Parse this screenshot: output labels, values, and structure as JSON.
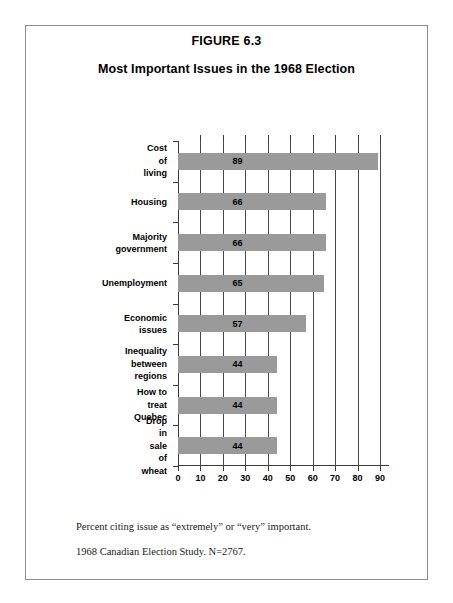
{
  "figure": {
    "number": "FIGURE 6.3",
    "title": "Most Important Issues in the 1968 Election"
  },
  "footnotes": [
    "Percent citing issue as “extremely” or “very” important.",
    "1968 Canadian Election Study.  N=2767."
  ],
  "colors": {
    "bar_fill": "#9a9a9a",
    "gridline": "#4a4a4a",
    "axis": "#3a3a3a",
    "border": "#8d8d8d",
    "text": "#000000"
  },
  "chart_data": {
    "type": "bar",
    "orientation": "horizontal",
    "title": "Most Important Issues in the 1968 Election",
    "subtitle": "FIGURE 6.3",
    "xlabel": "",
    "ylabel": "",
    "categories": [
      "Cost of living",
      "Housing",
      "Majority\ngovernment",
      "Unemployment",
      "Economic\nissues",
      "Inequality\nbetween\nregions",
      "How to treat\nQuebec",
      "Drop in sale of\nwheat"
    ],
    "values": [
      89,
      66,
      66,
      65,
      57,
      44,
      44,
      44
    ],
    "value_labels": [
      "89",
      "66",
      "66",
      "65",
      "57",
      "44",
      "44",
      "44"
    ],
    "xlim": [
      0,
      90
    ],
    "xticks": [
      0,
      10,
      20,
      30,
      40,
      50,
      60,
      70,
      80,
      90
    ],
    "xtick_labels": [
      "0",
      "10",
      "20",
      "30",
      "40",
      "50",
      "60",
      "70",
      "80",
      "90"
    ],
    "gridlines": [
      10,
      20,
      30,
      40,
      50,
      60,
      70,
      80,
      90
    ],
    "grid": true,
    "grid_axis": "x",
    "grid_over_bars": true,
    "legend": null,
    "legend_position": "none"
  }
}
